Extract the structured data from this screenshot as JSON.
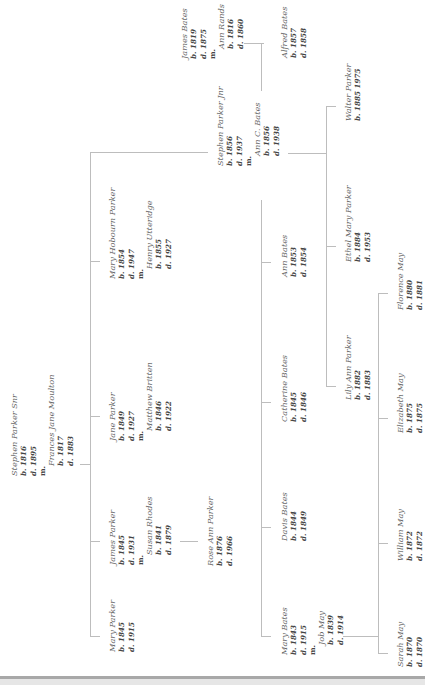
{
  "diagram": {
    "type": "family-tree",
    "orientation": "rotated-90-ccw",
    "line_color": "#bdbdbd",
    "people": {
      "stephen_snr": {
        "name": "Stephen Parker Snr",
        "born": "b. 1816",
        "died": "d. 1895",
        "married": "m.",
        "spouse": "Frances Jane Moulton",
        "spouse_born": "b. 1817",
        "spouse_died": "d. 1883"
      },
      "mary_parker": {
        "name": "Mary Parker",
        "born": "b. 1845",
        "died": "d. 1915"
      },
      "james_parker": {
        "name": "James Parker",
        "born": "b. 1845",
        "died": "d. 1931",
        "married": "m.",
        "spouse": "Susan Rhodes",
        "spouse_born": "b. 1841",
        "spouse_died": "d. 1879"
      },
      "rose_ann_parker": {
        "name": "Rose Ann Parker",
        "born": "b. 1876",
        "died": "d. 1966"
      },
      "jane_parker": {
        "name": "Jane Parker",
        "born": "b. 1849",
        "died": "d. 1927",
        "married": "m.",
        "spouse": "Matthew Britten",
        "spouse_born": "b. 1846",
        "spouse_died": "d. 1922"
      },
      "mary_hobourn_parker": {
        "name": "Mary Hobourn Parker",
        "born": "b. 1854",
        "died": "d. 1947",
        "married": "m.",
        "spouse": "Henry Utteridge",
        "spouse_born": "b. 1855",
        "spouse_died": "d. 1927"
      },
      "stephen_jnr": {
        "name": "Stephen Parker Jnr",
        "born": "b. 1856",
        "died": "d. 1937",
        "married": "m.",
        "spouse": "Ann C. Bates",
        "spouse_born": "b. 1856",
        "spouse_died": "d. 1938"
      },
      "james_bates": {
        "name": "James Bates",
        "born": "b. 1819",
        "died": "d. 1875",
        "married": "m.",
        "spouse": "Ann Rands",
        "spouse_born": "b. 1816",
        "spouse_died": "d. 1860"
      },
      "alfred_bates": {
        "name": "Alfred Bates",
        "born": "b. 1857",
        "died": "d. 1858"
      },
      "mary_bates": {
        "name": "Mary Bates",
        "born": "b. 1843",
        "died": "d. 1915",
        "married": "m.",
        "spouse": "Job May",
        "spouse_born": "b. 1839",
        "spouse_died": "d. 1914"
      },
      "davis_bates": {
        "name": "Davis Bates",
        "born": "b. 1844",
        "died": "d. 1849"
      },
      "catherine_bates": {
        "name": "Catherine Bates",
        "born": "b. 1845",
        "died": "d. 1846"
      },
      "ann_bates": {
        "name": "Ann Bates",
        "born": "b. 1853",
        "died": "d. 1854"
      },
      "lily_ann_parker": {
        "name": "Lily Ann Parker",
        "born": "b. 1882",
        "died": "d. 1883"
      },
      "ethel_mary_parker": {
        "name": "Ethel Mary Parker",
        "born": "b. 1884",
        "died": "d. 1953"
      },
      "walter_parker": {
        "name": "Walter Parker",
        "born": "b. 1885 1975"
      },
      "sarah_may": {
        "name": "Sarah May",
        "born": "b. 1870",
        "died": "d. 1870"
      },
      "william_may": {
        "name": "William May",
        "born": "b. 1872",
        "died": "d. 1872"
      },
      "elizabeth_may": {
        "name": "Elizabeth May",
        "born": "b. 1875",
        "died": "d. 1875"
      },
      "florence_may": {
        "name": "Florence May",
        "born": "b. 1880",
        "died": "d. 1881"
      }
    }
  }
}
